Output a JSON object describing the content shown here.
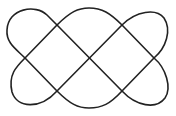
{
  "diagram": {
    "type": "knot-line-drawing",
    "stroke_color": "#222222",
    "background": "#ffffff",
    "crossings": 7
  }
}
